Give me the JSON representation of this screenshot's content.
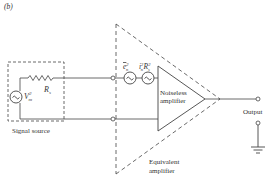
{
  "figure": {
    "panel_label": "(b)",
    "signal_source": {
      "label": "Signal source",
      "voltage_symbol": "V",
      "voltage_sub": "m",
      "voltage_sup": "2",
      "resistor_symbol": "R",
      "resistor_sub": "s"
    },
    "noise_sources": {
      "voltage_noise": {
        "symbol": "e",
        "sub": "n",
        "sup": "2"
      },
      "current_noise": {
        "symbol": "i",
        "sub": "n",
        "sup": "2",
        "times": "R",
        "times_sub": "s",
        "times_sup": "2"
      }
    },
    "amplifier": {
      "line1": "Noiseless",
      "line2": "amplifier"
    },
    "equivalent": {
      "line1": "Equivalent",
      "line2": "amplifier"
    },
    "output_label": "Output",
    "colors": {
      "line": "#444444",
      "text": "#333333",
      "background": "#ffffff"
    }
  }
}
